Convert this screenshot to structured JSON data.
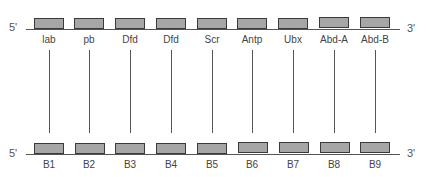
{
  "top_strand": {
    "five_prime": "5'",
    "three_prime": "3'",
    "genes": [
      "lab",
      "pb",
      "Dfd",
      "Dfd",
      "Scr",
      "Antp",
      "Ubx",
      "Abd-A",
      "Abd-B"
    ]
  },
  "bottom_strand": {
    "five_prime": "5'",
    "three_prime": "3'",
    "genes": [
      "B1",
      "B2",
      "B3",
      "B4",
      "B5",
      "B6",
      "B7",
      "B8",
      "B9"
    ]
  },
  "colors": {
    "gene_fill": "#a6a6a6",
    "gene_border": "#3a3a3a",
    "line": "#555555"
  }
}
